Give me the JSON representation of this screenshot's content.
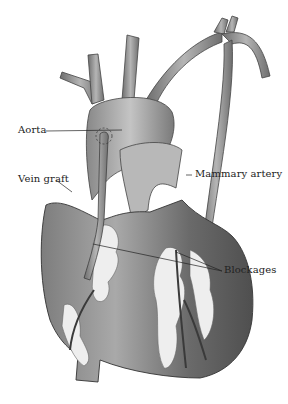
{
  "diagram": {
    "labels": {
      "aorta": "Aorta",
      "vein_graft": "Vein graft",
      "mammary_artery": "Mammary artery",
      "blockages": "Blockages"
    },
    "colors": {
      "background": "#ffffff",
      "heart_dark": "#555555",
      "heart_mid": "#8a8a8a",
      "heart_light": "#c8c8c8",
      "fat": "#eeeeee",
      "line": "#222222"
    }
  }
}
